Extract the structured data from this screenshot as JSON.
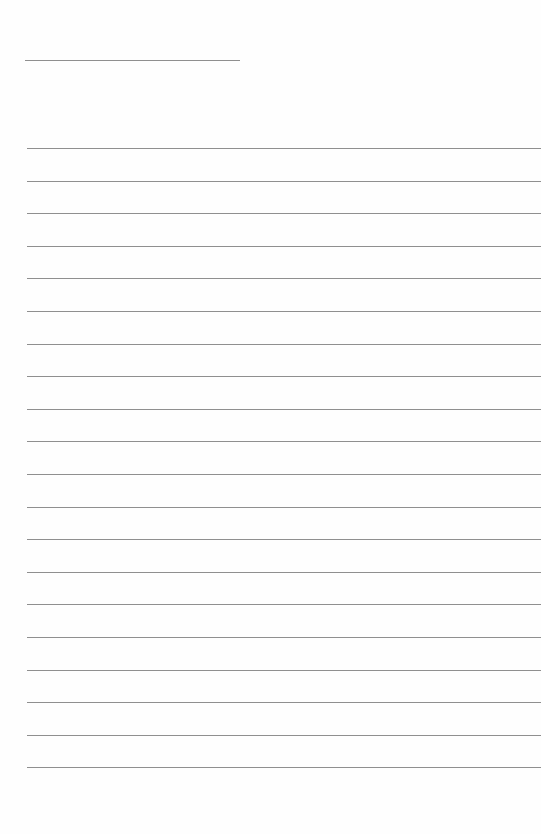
{
  "page": {
    "type": "blank lined page",
    "title_line": {
      "x": 25,
      "y": 60,
      "width": 215
    },
    "ruled_lines": {
      "count": 20,
      "start_y": 148,
      "spacing": 32.6,
      "left": 27
    },
    "line_color": "#8f8f8f",
    "background": "#fefefe"
  }
}
